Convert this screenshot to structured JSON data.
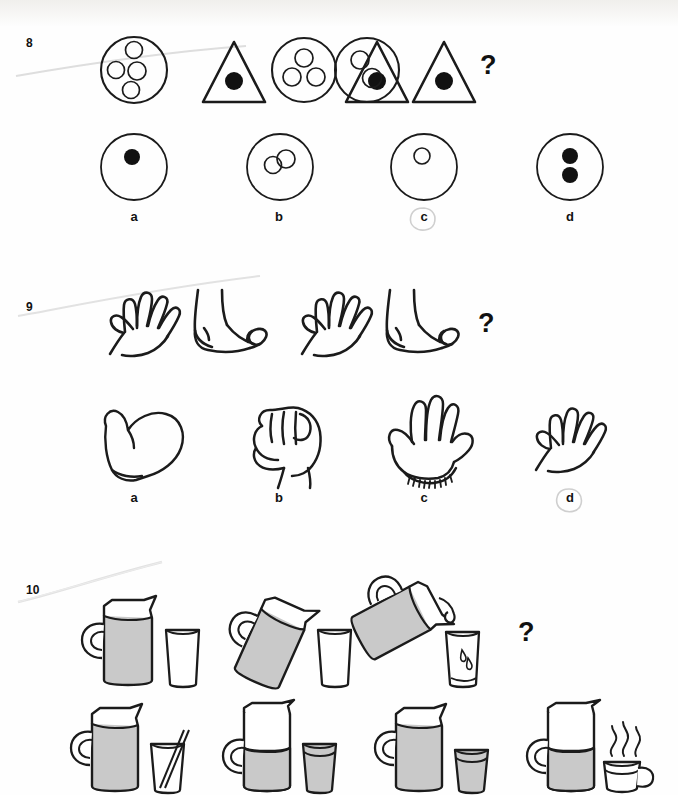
{
  "page": {
    "background_color": "#fefefe",
    "ink_color": "#1b1b1b",
    "fill_gray": "#c9c9c9",
    "question_mark": "?"
  },
  "questions": [
    {
      "number": "8",
      "prompt_mark": "?",
      "type": "shape-sequence",
      "sequence": [
        {
          "index": 1,
          "shape": "circle",
          "inner_count": 4,
          "inner_style": "outline",
          "arrangement": "diamond"
        },
        {
          "index": 2,
          "shape": "triangle",
          "inner_count": 1,
          "inner_style": "filled",
          "arrangement": "center"
        },
        {
          "index": 3,
          "shape": "circle",
          "inner_count": 3,
          "inner_style": "outline",
          "arrangement": "triangle"
        },
        {
          "index": 4,
          "shape": "triangle",
          "inner_count": 1,
          "inner_style": "filled",
          "arrangement": "center"
        },
        {
          "index": 5,
          "shape": "circle",
          "inner_count": 2,
          "inner_style": "outline",
          "arrangement": "diagonal"
        },
        {
          "index": 6,
          "shape": "triangle",
          "inner_count": 1,
          "inner_style": "filled",
          "arrangement": "center"
        }
      ],
      "options": [
        {
          "label": "a",
          "shape": "circle",
          "inner_count": 1,
          "inner_style": "filled",
          "arrangement": "center-upper",
          "selected": false
        },
        {
          "label": "b",
          "shape": "circle",
          "inner_count": 2,
          "inner_style": "outline",
          "arrangement": "diagonal",
          "selected": false
        },
        {
          "label": "c",
          "shape": "circle",
          "inner_count": 1,
          "inner_style": "outline",
          "arrangement": "upper",
          "selected": true
        },
        {
          "label": "d",
          "shape": "circle",
          "inner_count": 2,
          "inner_style": "filled",
          "arrangement": "vertical",
          "selected": false
        }
      ]
    },
    {
      "number": "9",
      "prompt_mark": "?",
      "type": "body-part-sequence",
      "sequence": [
        {
          "index": 1,
          "item": "hand"
        },
        {
          "index": 2,
          "item": "foot"
        },
        {
          "index": 3,
          "item": "hand"
        },
        {
          "index": 4,
          "item": "foot"
        }
      ],
      "options": [
        {
          "label": "a",
          "item": "mitten",
          "selected": false
        },
        {
          "label": "b",
          "item": "fist",
          "selected": false
        },
        {
          "label": "c",
          "item": "glove",
          "selected": false
        },
        {
          "label": "d",
          "item": "hand",
          "selected": true
        }
      ]
    },
    {
      "number": "10",
      "prompt_mark": "?",
      "type": "pouring-sequence",
      "sequence": [
        {
          "index": 1,
          "jug_tilt_deg": 0,
          "jug_fill": "full",
          "glass_fill": "empty",
          "pouring": false
        },
        {
          "index": 2,
          "jug_tilt_deg": 25,
          "jug_fill": "full",
          "glass_fill": "empty",
          "pouring": false
        },
        {
          "index": 3,
          "jug_tilt_deg": 70,
          "jug_fill": "partial",
          "glass_fill": "trace",
          "pouring": true
        }
      ],
      "options": [
        {
          "label": "a",
          "jug_fill": "full",
          "glass_fill": "empty",
          "glass_extra": "straw",
          "selected": false
        },
        {
          "label": "b",
          "jug_fill": "half",
          "glass_fill": "full",
          "glass_extra": "none",
          "selected": false
        },
        {
          "label": "c",
          "jug_fill": "full",
          "glass_fill": "full",
          "glass_extra": "none",
          "selected": false
        },
        {
          "label": "d",
          "jug_fill": "half",
          "glass_fill": "none",
          "glass_extra": "steaming-mug",
          "selected": false
        }
      ]
    }
  ]
}
